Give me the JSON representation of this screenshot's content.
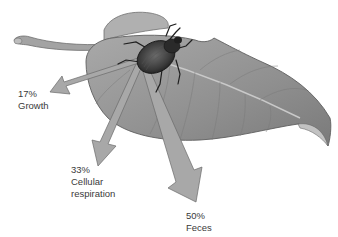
{
  "diagram": {
    "colors": {
      "background": "#ffffff",
      "leaf": "#9a9a9a",
      "leaf_dark": "#7d7d7d",
      "arrow": "#a8a8a8",
      "beetle": "#2e2e2e",
      "text": "#3a3a3a"
    },
    "flows": [
      {
        "id": "growth",
        "percent": "17%",
        "label_line1": "Growth",
        "label_line2": ""
      },
      {
        "id": "respiration",
        "percent": "33%",
        "label_line1": "Cellular",
        "label_line2": "respiration"
      },
      {
        "id": "feces",
        "percent": "50%",
        "label_line1": "Feces",
        "label_line2": ""
      }
    ]
  }
}
